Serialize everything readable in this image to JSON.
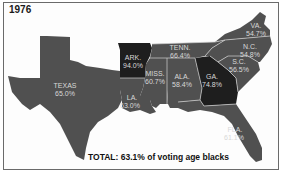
{
  "title": "1976",
  "total": "TOTAL: 63.1% of voting age blacks",
  "colors": {
    "state_default": "#505050",
    "state_dark": "#1e1e1e",
    "label": "#d8d8d8",
    "border": "#d0d0d0"
  },
  "states": [
    {
      "name": "TEXAS",
      "value": "65.0%"
    },
    {
      "name": "ARK.",
      "value": "94.0%"
    },
    {
      "name": "LA.",
      "value": "63.0%"
    },
    {
      "name": "MISS.",
      "value": "60.7%"
    },
    {
      "name": "TENN.",
      "value": "66.4%"
    },
    {
      "name": "ALA.",
      "value": "58.4%"
    },
    {
      "name": "GA.",
      "value": "74.8%"
    },
    {
      "name": "VA.",
      "value": "54.7%"
    },
    {
      "name": "N.C.",
      "value": "54.8%"
    },
    {
      "name": "S.C.",
      "value": "56.5%"
    },
    {
      "name": "FLA.",
      "value": "61.1%"
    }
  ]
}
